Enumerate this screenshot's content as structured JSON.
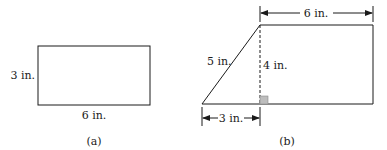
{
  "figures": [
    {
      "id": "a",
      "caption": "(a)",
      "shape": "rectangle",
      "labels": {
        "height": "3 in.",
        "width": "6 in."
      }
    },
    {
      "id": "b",
      "caption": "(b)",
      "shape": "parallelogram-decomposition",
      "labels": {
        "top_width": "6 in.",
        "slant_side": "5 in.",
        "height": "4 in.",
        "base_offset": "3 in."
      },
      "right_angle_marker_color": "#bdbdbd"
    }
  ],
  "colors": {
    "stroke": "#1a1a1a",
    "background": "#ffffff"
  }
}
